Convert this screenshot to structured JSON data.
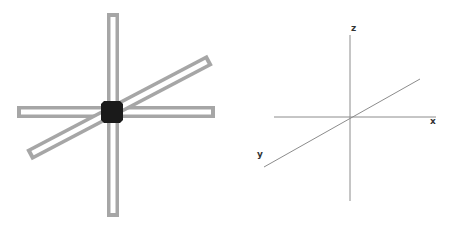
{
  "figure": {
    "left_panel": {
      "description": "Three hollow bars crossing at a central cube",
      "bars": [
        {
          "name": "vertical-bar",
          "x1": 113,
          "y1": 13,
          "x2": 113,
          "y2": 217
        },
        {
          "name": "horizontal-bar",
          "x1": 17,
          "y1": 112,
          "x2": 215,
          "y2": 112
        },
        {
          "name": "diagonal-bar",
          "x1": 29,
          "y1": 155,
          "x2": 210,
          "y2": 60
        }
      ],
      "bar_outer_width": 12,
      "bar_inner_width": 5,
      "bar_color": "#a6a6a6",
      "bar_inner_color": "#ffffff",
      "cube": {
        "cx": 112,
        "cy": 112,
        "size": 22,
        "color": "#1a1a1a"
      }
    },
    "right_panel": {
      "description": "3D coordinate axes",
      "axis_color": "#8c8c8c",
      "axes": [
        {
          "name": "z",
          "x1": 350,
          "y1": 35,
          "x2": 350,
          "y2": 201,
          "label": "z",
          "label_x": 351,
          "label_y": 31
        },
        {
          "name": "x",
          "x1": 274,
          "y1": 117,
          "x2": 436,
          "y2": 117,
          "label": "x",
          "label_x": 430,
          "label_y": 124
        },
        {
          "name": "y",
          "x1": 264,
          "y1": 167,
          "x2": 420,
          "y2": 79,
          "label": "y",
          "label_x": 257,
          "label_y": 157
        }
      ]
    }
  }
}
